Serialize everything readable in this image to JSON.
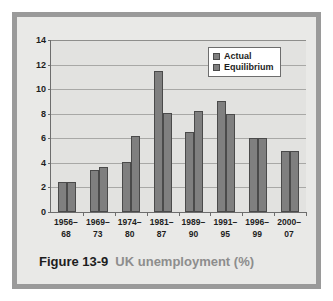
{
  "figure": {
    "caption_number": "Figure 13-9",
    "caption_title": "UK unemployment (%)",
    "frame_color": "#9a9a9a",
    "panel_color": "#e9e9e7"
  },
  "chart_data": {
    "type": "bar",
    "title": "UK unemployment (%)",
    "xlabel": "",
    "ylabel": "",
    "ylim": [
      0,
      14
    ],
    "yticks": [
      0,
      2,
      4,
      6,
      8,
      10,
      12,
      14
    ],
    "grid": true,
    "legend_position": "top-right",
    "bar_color": "#7f7f7f",
    "bar_border_color": "#4a4a4a",
    "categories": [
      {
        "line1": "1956–",
        "line2": "68"
      },
      {
        "line1": "1969–",
        "line2": "73"
      },
      {
        "line1": "1974–",
        "line2": "80"
      },
      {
        "line1": "1981–",
        "line2": "87"
      },
      {
        "line1": "1989–",
        "line2": "90"
      },
      {
        "line1": "1991–",
        "line2": "95"
      },
      {
        "line1": "1996–",
        "line2": "99"
      },
      {
        "line1": "2000–",
        "line2": "07"
      }
    ],
    "series": [
      {
        "name": "Actual",
        "values": [
          2.45,
          3.45,
          4.1,
          11.5,
          6.5,
          9.0,
          6.0,
          5.0
        ]
      },
      {
        "name": "Equilibrium",
        "values": [
          2.45,
          3.7,
          6.2,
          8.1,
          8.2,
          8.0,
          6.0,
          5.0
        ]
      }
    ]
  }
}
